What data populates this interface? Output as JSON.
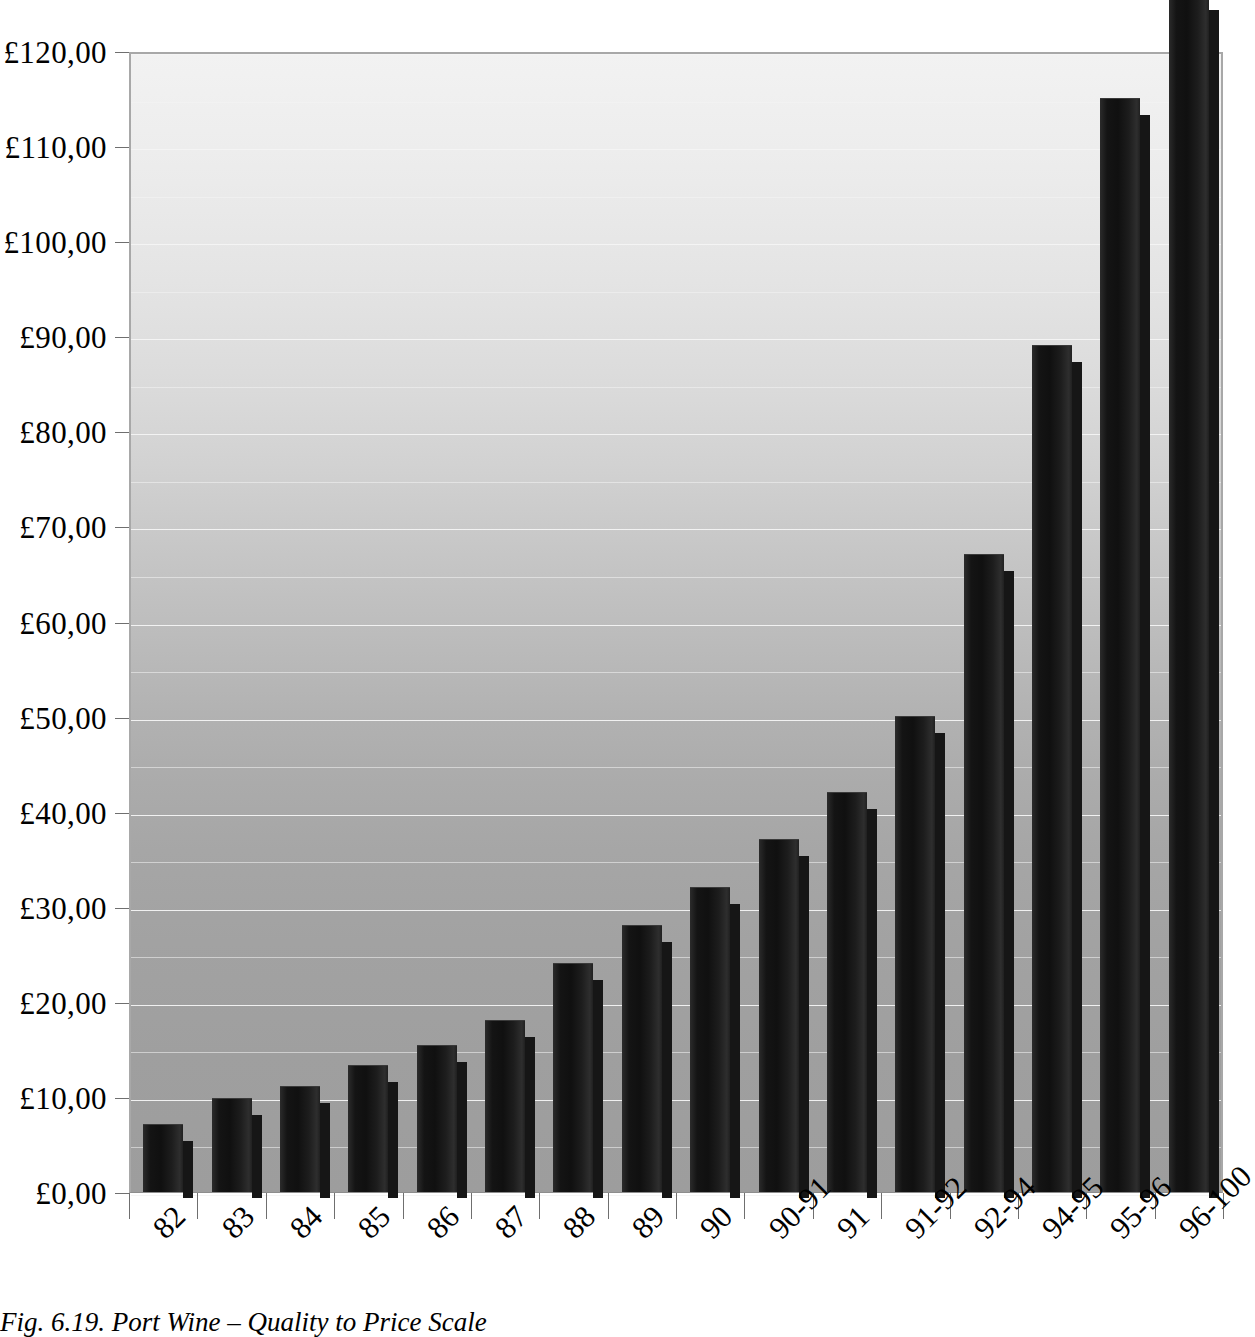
{
  "caption": "Fig. 6.19. Port Wine – Quality to Price Scale",
  "chart_data": {
    "type": "bar",
    "title": "Port Wine – Quality to Price Scale",
    "xlabel": "",
    "ylabel": "",
    "currency_symbol": "£",
    "decimal_separator": ",",
    "ylim": [
      0,
      120
    ],
    "ytick_step": 10,
    "grid": true,
    "gridlines_minor": true,
    "legend": "none",
    "categories": [
      "82",
      "83",
      "84",
      "85",
      "86",
      "87",
      "88",
      "89",
      "90",
      "90-91",
      "91",
      "91-92",
      "92-94",
      "94-95",
      "95-96",
      "96-100"
    ],
    "values": [
      7,
      9.8,
      11,
      13.25,
      15.4,
      18,
      24,
      28,
      32,
      37,
      42,
      50,
      67,
      89,
      115,
      126
    ],
    "ytick_labels": [
      "£0,00",
      "£10,00",
      "£20,00",
      "£30,00",
      "£40,00",
      "£50,00",
      "£60,00",
      "£70,00",
      "£80,00",
      "£90,00",
      "£100,00",
      "£110,00",
      "£120,00"
    ],
    "ytick_values": [
      0,
      10,
      20,
      30,
      40,
      50,
      60,
      70,
      80,
      90,
      100,
      110,
      120
    ]
  }
}
